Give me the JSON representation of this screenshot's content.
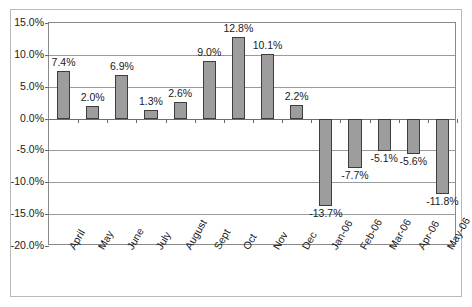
{
  "chart_data": {
    "type": "bar",
    "title": "",
    "subtitle": "",
    "xlabel": "",
    "ylabel": "",
    "ylim": [
      -20.0,
      15.0
    ],
    "ytick_labels": [
      "15.0%",
      "10.0%",
      "5.0%",
      "0.0%",
      "-5.0%",
      "-10.0%",
      "-15.0%",
      "-20.0%"
    ],
    "ytick_values": [
      15.0,
      10.0,
      5.0,
      0.0,
      -5.0,
      -10.0,
      -15.0,
      -20.0
    ],
    "grid": true,
    "legend": false,
    "legend_position": "none",
    "categories": [
      "April",
      "May",
      "June",
      "July",
      "August",
      "Sept",
      "Oct",
      "Nov",
      "Dec",
      "Jan-06",
      "Feb-06",
      "Mar-06",
      "Apr-06",
      "May-06"
    ],
    "values": [
      7.4,
      2.0,
      6.9,
      1.3,
      2.6,
      9.0,
      12.8,
      10.1,
      2.2,
      -13.7,
      -7.7,
      -5.1,
      -5.6,
      -11.8
    ],
    "data_labels": [
      "7.4%",
      "2.0%",
      "6.9%",
      "1.3%",
      "2.6%",
      "9.0%",
      "12.8%",
      "10.1%",
      "2.2%",
      "-13.7%",
      "-7.7%",
      "-5.1%",
      "-5.6%",
      "-11.8%"
    ],
    "bar_fill_color": "#9d9d9d",
    "bar_border_color": "#3d3d3d",
    "gridline_color": "#9a9a9a",
    "axis_color": "#6e6e6e",
    "frame_color": "#b9b9b9",
    "plot_background": "#ffffff",
    "label_rotation_deg": -60
  }
}
